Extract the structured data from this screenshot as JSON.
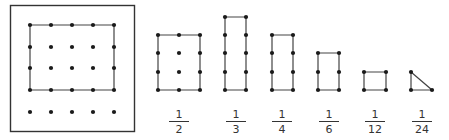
{
  "colors": {
    "dot": "#1a1a1a",
    "line": "#444444",
    "frame": "#333333",
    "text": "#333333",
    "background": "#ffffff"
  },
  "geoboard": {
    "frame": {
      "x": 10,
      "y": 5,
      "w": 124,
      "h": 126
    },
    "grid": {
      "cols_x": [
        30,
        51,
        72,
        93,
        114
      ],
      "rows_y": [
        25,
        47,
        68,
        90,
        112
      ]
    },
    "outline": [
      [
        30,
        25
      ],
      [
        114,
        25
      ],
      [
        114,
        90
      ],
      [
        30,
        90
      ]
    ]
  },
  "shapes": [
    {
      "label_num": "1",
      "label_den": "2",
      "label_cx": 179,
      "dots": [
        [
          158,
          35
        ],
        [
          179,
          35
        ],
        [
          200,
          35
        ],
        [
          158,
          53
        ],
        [
          179,
          53
        ],
        [
          200,
          53
        ],
        [
          158,
          72
        ],
        [
          179,
          72
        ],
        [
          200,
          72
        ],
        [
          158,
          90
        ],
        [
          179,
          90
        ],
        [
          200,
          90
        ]
      ],
      "outline": [
        [
          158,
          35
        ],
        [
          200,
          35
        ],
        [
          200,
          90
        ],
        [
          158,
          90
        ]
      ]
    },
    {
      "label_num": "1",
      "label_den": "3",
      "label_cx": 236,
      "dots": [
        [
          225,
          17
        ],
        [
          246,
          17
        ],
        [
          225,
          35
        ],
        [
          246,
          35
        ],
        [
          225,
          53
        ],
        [
          246,
          53
        ],
        [
          225,
          72
        ],
        [
          246,
          72
        ],
        [
          225,
          90
        ],
        [
          246,
          90
        ]
      ],
      "outline": [
        [
          225,
          17
        ],
        [
          246,
          17
        ],
        [
          246,
          90
        ],
        [
          225,
          90
        ]
      ]
    },
    {
      "label_num": "1",
      "label_den": "4",
      "label_cx": 282,
      "dots": [
        [
          272,
          35
        ],
        [
          293,
          35
        ],
        [
          272,
          53
        ],
        [
          293,
          53
        ],
        [
          272,
          72
        ],
        [
          293,
          72
        ],
        [
          272,
          90
        ],
        [
          293,
          90
        ]
      ],
      "outline": [
        [
          272,
          35
        ],
        [
          293,
          35
        ],
        [
          293,
          90
        ],
        [
          272,
          90
        ]
      ]
    },
    {
      "label_num": "1",
      "label_den": "6",
      "label_cx": 329,
      "dots": [
        [
          318,
          53
        ],
        [
          339,
          53
        ],
        [
          318,
          72
        ],
        [
          339,
          72
        ],
        [
          318,
          90
        ],
        [
          339,
          90
        ]
      ],
      "outline": [
        [
          318,
          53
        ],
        [
          339,
          53
        ],
        [
          339,
          90
        ],
        [
          318,
          90
        ]
      ]
    },
    {
      "label_num": "1",
      "label_den": "12",
      "label_cx": 375,
      "dots": [
        [
          364,
          72
        ],
        [
          386,
          72
        ],
        [
          364,
          90
        ],
        [
          386,
          90
        ]
      ],
      "outline": [
        [
          364,
          72
        ],
        [
          386,
          72
        ],
        [
          386,
          90
        ],
        [
          364,
          90
        ]
      ]
    },
    {
      "label_num": "1",
      "label_den": "24",
      "label_cx": 422,
      "dots": [
        [
          411,
          72
        ],
        [
          411,
          90
        ],
        [
          432,
          90
        ]
      ],
      "outline": [
        [
          411,
          72
        ],
        [
          432,
          90
        ],
        [
          411,
          90
        ]
      ]
    }
  ],
  "fraction_labels": [
    {
      "num": "1",
      "den": "2"
    },
    {
      "num": "1",
      "den": "3"
    },
    {
      "num": "1",
      "den": "4"
    },
    {
      "num": "1",
      "den": "6"
    },
    {
      "num": "1",
      "den": "12"
    },
    {
      "num": "1",
      "den": "24"
    }
  ]
}
